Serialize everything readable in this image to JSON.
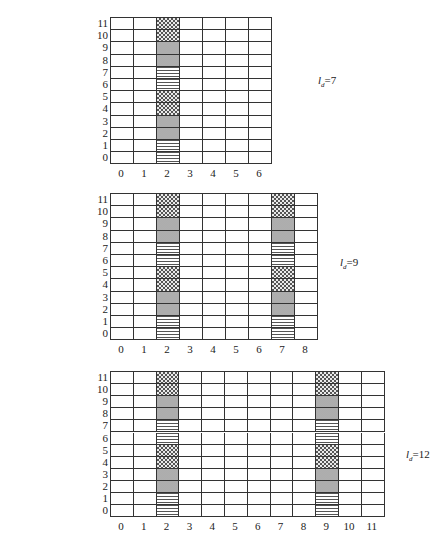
{
  "pattern_legend": {
    "check": "checkered (cross-hatch) fill",
    "gray": "gray dotted fill",
    "stripe": "horizontal-line fill"
  },
  "row_pattern": [
    "stripe",
    "stripe",
    "gray",
    "gray",
    "check",
    "check",
    "stripe",
    "stripe",
    "gray",
    "gray",
    "check",
    "check"
  ],
  "figures": [
    {
      "label_var": "l",
      "label_sub": "d",
      "label_value": "=7",
      "cols": 7,
      "rows": 12,
      "filled_columns": [
        2
      ],
      "x_ticks": [
        "0",
        "1",
        "2",
        "3",
        "4",
        "5",
        "6"
      ],
      "y_ticks": [
        "0",
        "1",
        "2",
        "3",
        "4",
        "5",
        "6",
        "7",
        "8",
        "9",
        "10",
        "11"
      ]
    },
    {
      "label_var": "l",
      "label_sub": "d",
      "label_value": "=9",
      "cols": 9,
      "rows": 12,
      "filled_columns": [
        2,
        7
      ],
      "x_ticks": [
        "0",
        "1",
        "2",
        "3",
        "4",
        "5",
        "6",
        "7",
        "8"
      ],
      "y_ticks": [
        "0",
        "1",
        "2",
        "3",
        "4",
        "5",
        "6",
        "7",
        "8",
        "9",
        "10",
        "11"
      ]
    },
    {
      "label_var": "l",
      "label_sub": "d",
      "label_value": "=12",
      "cols": 12,
      "rows": 12,
      "filled_columns": [
        2,
        9
      ],
      "x_ticks": [
        "0",
        "1",
        "2",
        "3",
        "4",
        "5",
        "6",
        "7",
        "8",
        "9",
        "10",
        "11"
      ],
      "y_ticks": [
        "0",
        "1",
        "2",
        "3",
        "4",
        "5",
        "6",
        "7",
        "8",
        "9",
        "10",
        "11"
      ]
    }
  ]
}
